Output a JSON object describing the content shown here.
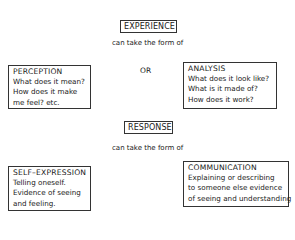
{
  "diagram": {
    "top": {
      "label": "EXPERIENCE",
      "connector": "can take the form of",
      "alternatives_separator": "OR",
      "left": {
        "title": "PERCEPTION",
        "lines": [
          "What does it mean?",
          "How does it make",
          "me feel? etc."
        ]
      },
      "right": {
        "title": "ANALYSIS",
        "lines": [
          "What does it look like?",
          "What is it made of?",
          "How does it work?"
        ]
      }
    },
    "bottom": {
      "label": "RESPONSE",
      "connector": "can take the form of",
      "left": {
        "title": "SELF–EXPRESSION",
        "lines": [
          "Telling oneself.",
          "Evidence of seeing",
          "and feeling."
        ]
      },
      "right": {
        "title": "COMMUNICATION",
        "lines": [
          "Explaining or describing",
          "to someone else evidence",
          "of seeing and understanding"
        ]
      }
    }
  },
  "colors": {
    "background": "#ffffff",
    "text": "#1a1a1a",
    "border": "#333333"
  }
}
